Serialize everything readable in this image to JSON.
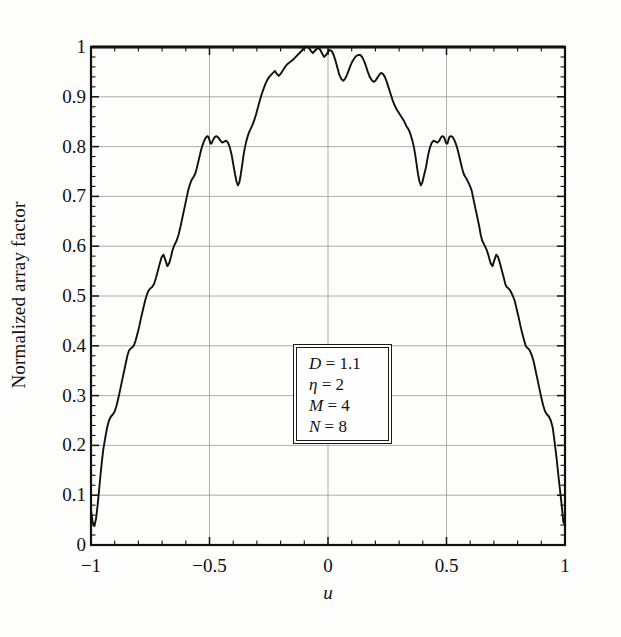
{
  "chart_data": {
    "type": "line",
    "title": "",
    "xlabel": "u",
    "ylabel": "Normalized array factor",
    "xlim": [
      -1,
      1
    ],
    "ylim": [
      0,
      1
    ],
    "grid": true,
    "legend_position": "none",
    "xticks": [
      {
        "value": -1,
        "label": "−1"
      },
      {
        "value": -0.5,
        "label": "−0.5"
      },
      {
        "value": 0,
        "label": "0"
      },
      {
        "value": 0.5,
        "label": "0.5"
      },
      {
        "value": 1,
        "label": "1"
      }
    ],
    "yticks": [
      {
        "value": 0,
        "label": "0"
      },
      {
        "value": 0.1,
        "label": "0.1"
      },
      {
        "value": 0.2,
        "label": "0.2"
      },
      {
        "value": 0.3,
        "label": "0.3"
      },
      {
        "value": 0.4,
        "label": "0.4"
      },
      {
        "value": 0.5,
        "label": "0.5"
      },
      {
        "value": 0.6,
        "label": "0.6"
      },
      {
        "value": 0.7,
        "label": "0.7"
      },
      {
        "value": 0.8,
        "label": "0.8"
      },
      {
        "value": 0.9,
        "label": "0.9"
      },
      {
        "value": 1,
        "label": "1"
      }
    ],
    "minor_xticks_per_interval": 5,
    "minor_yticks_per_interval": 5,
    "series": [
      {
        "name": "Normalized array factor",
        "color": "#111111",
        "x": [
          -1.0,
          -0.993,
          -0.986,
          -0.979,
          -0.972,
          -0.966,
          -0.96,
          -0.954,
          -0.948,
          -0.94,
          -0.932,
          -0.924,
          -0.916,
          -0.908,
          -0.9,
          -0.892,
          -0.884,
          -0.876,
          -0.868,
          -0.86,
          -0.852,
          -0.846,
          -0.84,
          -0.834,
          -0.828,
          -0.82,
          -0.812,
          -0.804,
          -0.796,
          -0.788,
          -0.78,
          -0.772,
          -0.766,
          -0.76,
          -0.754,
          -0.748,
          -0.742,
          -0.734,
          -0.726,
          -0.718,
          -0.71,
          -0.702,
          -0.694,
          -0.686,
          -0.678,
          -0.67,
          -0.662,
          -0.656,
          -0.65,
          -0.644,
          -0.638,
          -0.63,
          -0.622,
          -0.614,
          -0.606,
          -0.598,
          -0.59,
          -0.584,
          -0.578,
          -0.572,
          -0.566,
          -0.56,
          -0.554,
          -0.548,
          -0.542,
          -0.536,
          -0.53,
          -0.524,
          -0.518,
          -0.512,
          -0.508,
          -0.504,
          -0.5,
          -0.496,
          -0.492,
          -0.488,
          -0.482,
          -0.476,
          -0.47,
          -0.462,
          -0.454,
          -0.446,
          -0.438,
          -0.43,
          -0.422,
          -0.414,
          -0.406,
          -0.398,
          -0.392,
          -0.386,
          -0.38,
          -0.374,
          -0.368,
          -0.362,
          -0.356,
          -0.35,
          -0.344,
          -0.338,
          -0.332,
          -0.326,
          -0.32,
          -0.312,
          -0.304,
          -0.296,
          -0.288,
          -0.28,
          -0.272,
          -0.264,
          -0.256,
          -0.248,
          -0.24,
          -0.232,
          -0.224,
          -0.216,
          -0.208,
          -0.2,
          -0.192,
          -0.184,
          -0.176,
          -0.168,
          -0.16,
          -0.152,
          -0.144,
          -0.136,
          -0.128,
          -0.12,
          -0.112,
          -0.104,
          -0.096,
          -0.088,
          -0.08,
          -0.072,
          -0.064,
          -0.056,
          -0.048,
          -0.04,
          -0.032,
          -0.024,
          -0.016,
          -0.008,
          0.0,
          0.008,
          0.016,
          0.024,
          0.032,
          0.04,
          0.048,
          0.056,
          0.064,
          0.072,
          0.08,
          0.088,
          0.096,
          0.104,
          0.112,
          0.12,
          0.128,
          0.136,
          0.144,
          0.152,
          0.16,
          0.168,
          0.176,
          0.184,
          0.192,
          0.2,
          0.208,
          0.216,
          0.224,
          0.232,
          0.24,
          0.248,
          0.256,
          0.264,
          0.272,
          0.28,
          0.288,
          0.296,
          0.304,
          0.312,
          0.32,
          0.326,
          0.332,
          0.338,
          0.344,
          0.35,
          0.356,
          0.362,
          0.368,
          0.374,
          0.38,
          0.386,
          0.392,
          0.398,
          0.406,
          0.414,
          0.422,
          0.43,
          0.438,
          0.446,
          0.454,
          0.462,
          0.47,
          0.476,
          0.482,
          0.488,
          0.492,
          0.496,
          0.5,
          0.504,
          0.508,
          0.512,
          0.518,
          0.524,
          0.53,
          0.536,
          0.542,
          0.548,
          0.554,
          0.56,
          0.566,
          0.572,
          0.578,
          0.584,
          0.59,
          0.598,
          0.606,
          0.614,
          0.622,
          0.63,
          0.638,
          0.644,
          0.65,
          0.656,
          0.662,
          0.67,
          0.678,
          0.686,
          0.694,
          0.702,
          0.71,
          0.718,
          0.726,
          0.734,
          0.742,
          0.748,
          0.754,
          0.76,
          0.766,
          0.772,
          0.78,
          0.788,
          0.796,
          0.804,
          0.812,
          0.82,
          0.828,
          0.834,
          0.84,
          0.846,
          0.852,
          0.86,
          0.868,
          0.876,
          0.884,
          0.892,
          0.9,
          0.908,
          0.916,
          0.924,
          0.932,
          0.94,
          0.948,
          0.954,
          0.96,
          0.966,
          0.972,
          0.979,
          0.986,
          0.993,
          1.0
        ],
        "y": [
          0.07,
          0.046,
          0.038,
          0.052,
          0.08,
          0.11,
          0.14,
          0.168,
          0.192,
          0.215,
          0.236,
          0.25,
          0.258,
          0.262,
          0.268,
          0.28,
          0.296,
          0.314,
          0.332,
          0.35,
          0.368,
          0.381,
          0.39,
          0.394,
          0.396,
          0.4,
          0.41,
          0.424,
          0.44,
          0.458,
          0.474,
          0.49,
          0.5,
          0.508,
          0.513,
          0.516,
          0.518,
          0.524,
          0.536,
          0.55,
          0.565,
          0.578,
          0.583,
          0.572,
          0.56,
          0.566,
          0.58,
          0.592,
          0.6,
          0.606,
          0.612,
          0.624,
          0.64,
          0.658,
          0.676,
          0.694,
          0.712,
          0.722,
          0.73,
          0.736,
          0.74,
          0.746,
          0.756,
          0.768,
          0.78,
          0.792,
          0.802,
          0.81,
          0.816,
          0.82,
          0.821,
          0.819,
          0.813,
          0.806,
          0.806,
          0.81,
          0.816,
          0.82,
          0.821,
          0.818,
          0.812,
          0.808,
          0.81,
          0.812,
          0.808,
          0.798,
          0.782,
          0.76,
          0.744,
          0.73,
          0.722,
          0.728,
          0.744,
          0.764,
          0.784,
          0.8,
          0.812,
          0.822,
          0.83,
          0.836,
          0.842,
          0.852,
          0.864,
          0.878,
          0.892,
          0.905,
          0.916,
          0.926,
          0.934,
          0.94,
          0.944,
          0.948,
          0.952,
          0.946,
          0.942,
          0.946,
          0.952,
          0.958,
          0.963,
          0.967,
          0.97,
          0.973,
          0.976,
          0.98,
          0.984,
          0.988,
          0.992,
          0.996,
          0.999,
          1.001,
          0.998,
          0.992,
          0.988,
          0.992,
          0.996,
          0.998,
          0.994,
          0.986,
          0.98,
          0.984,
          0.99,
          0.994,
          0.992,
          0.984,
          0.972,
          0.958,
          0.944,
          0.936,
          0.932,
          0.936,
          0.944,
          0.954,
          0.964,
          0.972,
          0.978,
          0.982,
          0.984,
          0.984,
          0.98,
          0.972,
          0.962,
          0.95,
          0.94,
          0.934,
          0.93,
          0.932,
          0.938,
          0.944,
          0.948,
          0.946,
          0.94,
          0.93,
          0.918,
          0.906,
          0.894,
          0.884,
          0.876,
          0.87,
          0.864,
          0.858,
          0.852,
          0.846,
          0.84,
          0.836,
          0.83,
          0.822,
          0.812,
          0.8,
          0.784,
          0.764,
          0.744,
          0.73,
          0.722,
          0.728,
          0.744,
          0.76,
          0.782,
          0.798,
          0.808,
          0.812,
          0.81,
          0.808,
          0.812,
          0.818,
          0.821,
          0.82,
          0.816,
          0.81,
          0.806,
          0.806,
          0.813,
          0.819,
          0.821,
          0.82,
          0.816,
          0.81,
          0.802,
          0.792,
          0.78,
          0.768,
          0.756,
          0.746,
          0.74,
          0.736,
          0.73,
          0.722,
          0.712,
          0.694,
          0.676,
          0.658,
          0.64,
          0.624,
          0.612,
          0.606,
          0.6,
          0.592,
          0.58,
          0.566,
          0.56,
          0.572,
          0.583,
          0.578,
          0.565,
          0.55,
          0.536,
          0.524,
          0.518,
          0.516,
          0.513,
          0.508,
          0.5,
          0.49,
          0.474,
          0.458,
          0.44,
          0.424,
          0.41,
          0.4,
          0.396,
          0.394,
          0.39,
          0.381,
          0.368,
          0.35,
          0.332,
          0.314,
          0.296,
          0.28,
          0.268,
          0.262,
          0.258,
          0.25,
          0.236,
          0.215,
          0.192,
          0.168,
          0.14,
          0.11,
          0.08,
          0.046,
          0.04
        ]
      }
    ],
    "annotation": {
      "rows": [
        {
          "symbol": "D",
          "eq": " = ",
          "value": "1.1"
        },
        {
          "symbol": "η",
          "eq": " = ",
          "value": "2"
        },
        {
          "symbol": "M",
          "eq": " = ",
          "value": "4"
        },
        {
          "symbol": "N",
          "eq": " = ",
          "value": "8"
        }
      ]
    }
  },
  "plot_geometry": {
    "left": 91,
    "right": 565,
    "top": 47,
    "bottom": 545
  }
}
